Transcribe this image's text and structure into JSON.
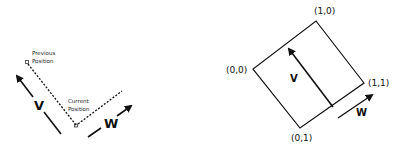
{
  "left_diagram": {
    "previous_label_line1": "Previous",
    "previous_label_line2": "Position",
    "current_label_line1": "Current",
    "current_label_line2": "Position",
    "v_label": "V",
    "w_label": "W"
  },
  "right_diagram": {
    "corner_top": "(1,0)",
    "corner_left": "(0,0)",
    "corner_right": "(1,1)",
    "corner_bottom": "(0,1)",
    "v_label": "V",
    "w_label": "W"
  },
  "colors": {
    "stroke": "#111111",
    "background": "#ffffff"
  }
}
